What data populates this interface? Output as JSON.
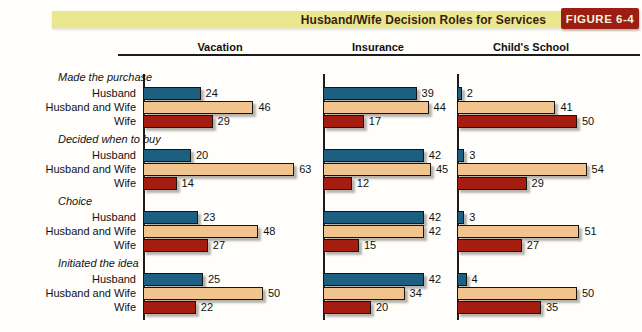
{
  "title_bar": {
    "title": "Husband/Wife Decision Roles for Services",
    "figure_label": "FIGURE 6-4"
  },
  "colors": {
    "band_yellow": "#eae88f",
    "figure_red": "#9c1d12",
    "husband": "#1d5f80",
    "husband_and_wife": "#f1c38d",
    "wife": "#a41d10"
  },
  "chart_data": {
    "type": "bar",
    "orientation": "horizontal",
    "title": "Husband/Wife Decision Roles for Services",
    "figure_label": "FIGURE 6-4",
    "panels": [
      "Vacation",
      "Insurance",
      "Child's School"
    ],
    "series": [
      "Husband",
      "Husband and Wife",
      "Wife"
    ],
    "groups": [
      {
        "name": "Made the purchase",
        "values": [
          [
            24,
            46,
            29
          ],
          [
            39,
            44,
            17
          ],
          [
            2,
            41,
            50
          ]
        ]
      },
      {
        "name": "Decided when to buy",
        "values": [
          [
            20,
            63,
            14
          ],
          [
            42,
            45,
            12
          ],
          [
            3,
            54,
            29
          ]
        ]
      },
      {
        "name": "Choice",
        "values": [
          [
            23,
            48,
            27
          ],
          [
            42,
            42,
            15
          ],
          [
            3,
            51,
            27
          ]
        ]
      },
      {
        "name": "Initiated the idea",
        "values": [
          [
            25,
            50,
            22
          ],
          [
            42,
            34,
            20
          ],
          [
            4,
            50,
            35
          ]
        ]
      }
    ],
    "value_range": [
      0,
      63
    ],
    "value_labels_shown": true,
    "legend_position": "none",
    "grid": false
  }
}
